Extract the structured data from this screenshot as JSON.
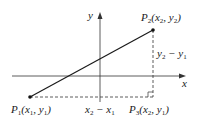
{
  "diagram": {
    "axes": {
      "x_label": "x",
      "y_label": "y"
    },
    "points": [
      {
        "id": "P1",
        "name": "P",
        "sub": "1",
        "coords_text": "(x1, y1)",
        "label_parts": [
          "P",
          "1",
          "(x",
          "1",
          ", y",
          "1",
          ")"
        ]
      },
      {
        "id": "P2",
        "name": "P",
        "sub": "2",
        "coords_text": "(x2, y2)",
        "label_parts": [
          "P",
          "2",
          "(x",
          "2",
          ", y",
          "2",
          ")"
        ]
      },
      {
        "id": "P3",
        "name": "P",
        "sub": "3",
        "coords_text": "(x2, y1)",
        "label_parts": [
          "P",
          "3",
          "(x",
          "2",
          ", y",
          "1",
          ")"
        ]
      }
    ],
    "distances": {
      "horizontal": {
        "text": "x2 − x1",
        "parts": [
          "x",
          "2",
          " − x",
          "1"
        ]
      },
      "vertical": {
        "text": "y2 − y1",
        "parts": [
          "y",
          "2",
          " − y",
          "1"
        ]
      }
    },
    "colors": {
      "line": "#1a1a1a",
      "dashed": "#333333",
      "background": "#ffffff"
    }
  }
}
